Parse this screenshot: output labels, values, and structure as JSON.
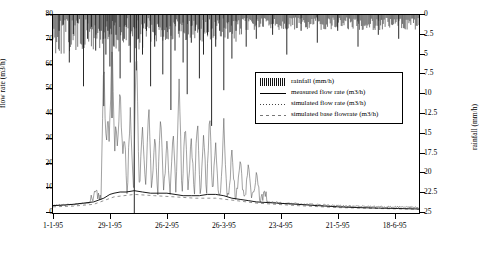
{
  "chart_data": {
    "type": "line",
    "title": "",
    "xlabel": "",
    "ylabel_left": "flow rate (m3/h)",
    "ylabel_right": "rainfall (mm/h)",
    "grid": false,
    "legend_position": "inside-top-center",
    "y_left": {
      "min": 0,
      "max": 80,
      "ticks": [
        0,
        10,
        20,
        30,
        40,
        50,
        60,
        70,
        80
      ],
      "tick_labels": [
        "0",
        "10",
        "20",
        "30",
        "40",
        "50",
        "60",
        "70",
        "80"
      ]
    },
    "y_right": {
      "min": 0,
      "max": 25,
      "inverted": true,
      "ticks": [
        0,
        2.5,
        5,
        7.5,
        10,
        12.5,
        15,
        17.5,
        20,
        22.5,
        25
      ],
      "tick_labels": [
        "0",
        "2.5",
        "5",
        "7.5",
        "10",
        "12.5",
        "15",
        "17.5",
        "20",
        "22.5",
        "25"
      ]
    },
    "x_axis": {
      "tick_labels": [
        "1-1-95",
        "29-1-95",
        "26-2-95",
        "26-3-95",
        "23-4-95",
        "21-5-95",
        "18-6-95"
      ],
      "tick_positions_days": [
        0,
        28,
        56,
        84,
        112,
        140,
        168
      ],
      "range_days": [
        0,
        180
      ]
    },
    "legend": [
      {
        "label": "rainfall (mm/h)",
        "key": "bar"
      },
      {
        "label": "measured flow rate (m3/h)",
        "key": "solid-line"
      },
      {
        "label": "simulated flow rate (m3/h)",
        "key": "dotted-line"
      },
      {
        "label": "simulated base flowrate (m3/h)",
        "key": "dashed-line"
      }
    ],
    "series": [
      {
        "name": "rainfall (mm/h)",
        "axis": "right",
        "type": "bar-downward",
        "points": [
          [
            3,
            2.0
          ],
          [
            5,
            1.2
          ],
          [
            8,
            6.0
          ],
          [
            10,
            2.4
          ],
          [
            12,
            1.0
          ],
          [
            15,
            9.0
          ],
          [
            17,
            3.0
          ],
          [
            19,
            1.5
          ],
          [
            21,
            4.5
          ],
          [
            23,
            2.0
          ],
          [
            25,
            11.5
          ],
          [
            26,
            5.0
          ],
          [
            27,
            2.0
          ],
          [
            28,
            6.5
          ],
          [
            29,
            13.0
          ],
          [
            30,
            4.0
          ],
          [
            31,
            2.5
          ],
          [
            33,
            8.0
          ],
          [
            35,
            3.0
          ],
          [
            36,
            1.5
          ],
          [
            38,
            6.0
          ],
          [
            40,
            25.0
          ],
          [
            41,
            7.0
          ],
          [
            42,
            3.0
          ],
          [
            44,
            5.0
          ],
          [
            46,
            2.0
          ],
          [
            48,
            9.0
          ],
          [
            50,
            4.0
          ],
          [
            52,
            1.5
          ],
          [
            54,
            7.5
          ],
          [
            56,
            3.0
          ],
          [
            58,
            12.0
          ],
          [
            60,
            4.5
          ],
          [
            62,
            2.0
          ],
          [
            64,
            6.0
          ],
          [
            66,
            10.0
          ],
          [
            68,
            3.5
          ],
          [
            70,
            2.0
          ],
          [
            72,
            8.0
          ],
          [
            74,
            5.0
          ],
          [
            76,
            2.5
          ],
          [
            78,
            14.0
          ],
          [
            80,
            4.0
          ],
          [
            82,
            2.0
          ],
          [
            84,
            9.5
          ],
          [
            86,
            3.0
          ],
          [
            88,
            5.5
          ],
          [
            90,
            2.0
          ],
          [
            95,
            4.0
          ],
          [
            100,
            3.0
          ],
          [
            108,
            2.5
          ],
          [
            115,
            5.0
          ],
          [
            122,
            2.0
          ],
          [
            130,
            3.5
          ],
          [
            140,
            2.0
          ],
          [
            150,
            4.0
          ],
          [
            160,
            2.5
          ],
          [
            170,
            3.0
          ]
        ]
      },
      {
        "name": "measured flow rate (m3/h)",
        "axis": "left",
        "type": "line",
        "points": [
          [
            0,
            3.0
          ],
          [
            5,
            3.2
          ],
          [
            10,
            3.5
          ],
          [
            15,
            4.0
          ],
          [
            20,
            4.5
          ],
          [
            25,
            6.0
          ],
          [
            28,
            7.5
          ],
          [
            30,
            8.0
          ],
          [
            33,
            8.5
          ],
          [
            36,
            8.5
          ],
          [
            40,
            9.0
          ],
          [
            44,
            8.5
          ],
          [
            48,
            8.0
          ],
          [
            52,
            8.0
          ],
          [
            56,
            8.0
          ],
          [
            60,
            7.5
          ],
          [
            64,
            7.0
          ],
          [
            68,
            7.0
          ],
          [
            72,
            7.0
          ],
          [
            76,
            7.5
          ],
          [
            80,
            7.5
          ],
          [
            84,
            7.0
          ],
          [
            88,
            6.0
          ],
          [
            92,
            5.5
          ],
          [
            96,
            5.0
          ],
          [
            100,
            4.5
          ],
          [
            110,
            4.0
          ],
          [
            120,
            3.5
          ],
          [
            130,
            3.0
          ],
          [
            140,
            2.5
          ],
          [
            150,
            2.2
          ],
          [
            160,
            2.0
          ],
          [
            170,
            1.8
          ],
          [
            180,
            1.6
          ]
        ]
      },
      {
        "name": "simulated flow rate (m3/h)",
        "axis": "left",
        "type": "spiky-line",
        "peaks": [
          [
            25,
            55
          ],
          [
            27,
            36
          ],
          [
            29,
            68
          ],
          [
            31,
            30
          ],
          [
            33,
            44
          ],
          [
            35,
            25
          ],
          [
            38,
            33
          ],
          [
            41,
            58
          ],
          [
            44,
            26
          ],
          [
            47,
            35
          ],
          [
            50,
            22
          ],
          [
            53,
            30
          ],
          [
            56,
            20
          ],
          [
            59,
            24
          ],
          [
            62,
            45
          ],
          [
            65,
            28
          ],
          [
            68,
            22
          ],
          [
            71,
            30
          ],
          [
            74,
            25
          ],
          [
            77,
            32
          ],
          [
            80,
            20
          ],
          [
            84,
            28
          ],
          [
            88,
            18
          ],
          [
            92,
            14
          ],
          [
            96,
            12
          ],
          [
            100,
            10
          ]
        ]
      },
      {
        "name": "simulated base flowrate (m3/h)",
        "axis": "left",
        "type": "line",
        "points": [
          [
            0,
            2.5
          ],
          [
            10,
            2.8
          ],
          [
            20,
            3.5
          ],
          [
            30,
            6.5
          ],
          [
            40,
            7.5
          ],
          [
            50,
            7.0
          ],
          [
            60,
            6.5
          ],
          [
            70,
            6.0
          ],
          [
            80,
            6.0
          ],
          [
            90,
            5.0
          ],
          [
            100,
            4.0
          ],
          [
            120,
            3.0
          ],
          [
            140,
            2.2
          ],
          [
            160,
            1.8
          ],
          [
            180,
            1.5
          ]
        ]
      }
    ]
  }
}
